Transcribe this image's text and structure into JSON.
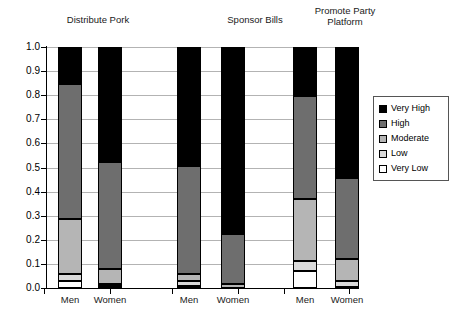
{
  "chart_data": {
    "type": "bar",
    "subtype": "stacked-bar-100",
    "title": "",
    "xlabel": "",
    "ylabel": "",
    "ylim": [
      0.0,
      1.0
    ],
    "grid": true,
    "legend_position": "right",
    "group_titles": [
      "Distribute Pork",
      "Sponsor Bills",
      "Promote Party\nPlatform"
    ],
    "categories": [
      "Men",
      "Women",
      "Men",
      "Women",
      "Men",
      "Women"
    ],
    "ytick_labels": [
      "1.0",
      "0.9",
      "0.8",
      "0.7",
      "0.6",
      "0.5",
      "0.4",
      "0.3",
      "0.2",
      "0.1",
      "0.0"
    ],
    "ytick_values": [
      1.0,
      0.9,
      0.8,
      0.7,
      0.6,
      0.5,
      0.4,
      0.3,
      0.2,
      0.1,
      0.0
    ],
    "series": [
      {
        "name": "Very High",
        "color": "#000000",
        "values": [
          0.155,
          0.478,
          0.492,
          0.775,
          0.203,
          0.542
        ]
      },
      {
        "name": "High",
        "color": "#6e6e6e",
        "values": [
          0.557,
          0.443,
          0.45,
          0.21,
          0.428,
          0.338
        ]
      },
      {
        "name": "Moderate",
        "color": "#b5b5b5",
        "values": [
          0.228,
          0.063,
          0.03,
          0.015,
          0.258,
          0.092
        ]
      },
      {
        "name": "Low",
        "color": "#d9d9d9",
        "values": [
          0.03,
          0.008,
          0.02,
          0.0,
          0.041,
          0.023
        ]
      },
      {
        "name": "Very Low",
        "color": "#ffffff",
        "values": [
          0.03,
          0.008,
          0.008,
          0.0,
          0.07,
          0.005
        ]
      }
    ],
    "bars": [
      {
        "group": "Distribute Pork",
        "category": "Men",
        "cumulative_tops": {
          "very_low": 0.03,
          "low": 0.06,
          "moderate": 0.288,
          "high": 0.845,
          "very_high": 1.0
        }
      },
      {
        "group": "Distribute Pork",
        "category": "Women",
        "cumulative_tops": {
          "very_low": 0.008,
          "low": 0.016,
          "moderate": 0.079,
          "high": 0.522,
          "very_high": 1.0
        }
      },
      {
        "group": "Sponsor Bills",
        "category": "Men",
        "cumulative_tops": {
          "very_low": 0.008,
          "low": 0.028,
          "moderate": 0.058,
          "high": 0.508,
          "very_high": 1.0
        }
      },
      {
        "group": "Sponsor Bills",
        "category": "Women",
        "cumulative_tops": {
          "very_low": 0.0,
          "low": 0.0,
          "moderate": 0.015,
          "high": 0.225,
          "very_high": 1.0
        }
      },
      {
        "group": "Promote Party Platform",
        "category": "Men",
        "cumulative_tops": {
          "very_low": 0.07,
          "low": 0.111,
          "moderate": 0.369,
          "high": 0.797,
          "very_high": 1.0
        }
      },
      {
        "group": "Promote Party Platform",
        "category": "Women",
        "cumulative_tops": {
          "very_low": 0.005,
          "low": 0.028,
          "moderate": 0.12,
          "high": 0.458,
          "very_high": 1.0
        }
      }
    ]
  },
  "legend": {
    "items": [
      {
        "label": "Very High",
        "color": "#000000"
      },
      {
        "label": "High",
        "color": "#6e6e6e"
      },
      {
        "label": "Moderate",
        "color": "#b5b5b5"
      },
      {
        "label": "Low",
        "color": "#d9d9d9"
      },
      {
        "label": "Very Low",
        "color": "#ffffff"
      }
    ]
  }
}
